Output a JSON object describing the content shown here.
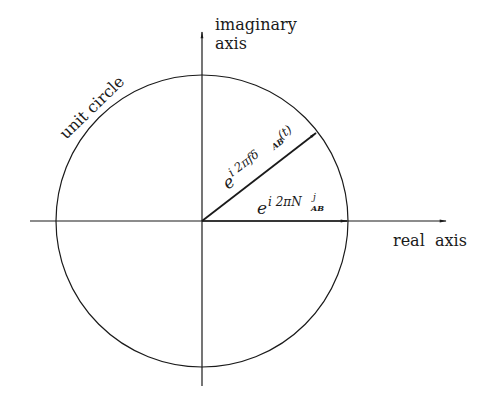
{
  "diagram": {
    "type": "complex-plane-phasor",
    "labels": {
      "imaginary_axis_line1": "imaginary",
      "imaginary_axis_line2": "axis",
      "real_axis": "real  axis",
      "unit_circle": "unit circle"
    },
    "vectors": [
      {
        "name": "phase-vector",
        "base": "e",
        "exponent": "i 2πfδ",
        "subscript": "AB",
        "suffix": "(t)",
        "angle_deg": 37
      },
      {
        "name": "ambiguity-vector",
        "base": "e",
        "exponent": "i 2πN",
        "superscript": "j",
        "subscript": "AB",
        "angle_deg": 0
      }
    ],
    "colors": {
      "stroke": "#1a1a1a",
      "background": "#ffffff"
    }
  }
}
